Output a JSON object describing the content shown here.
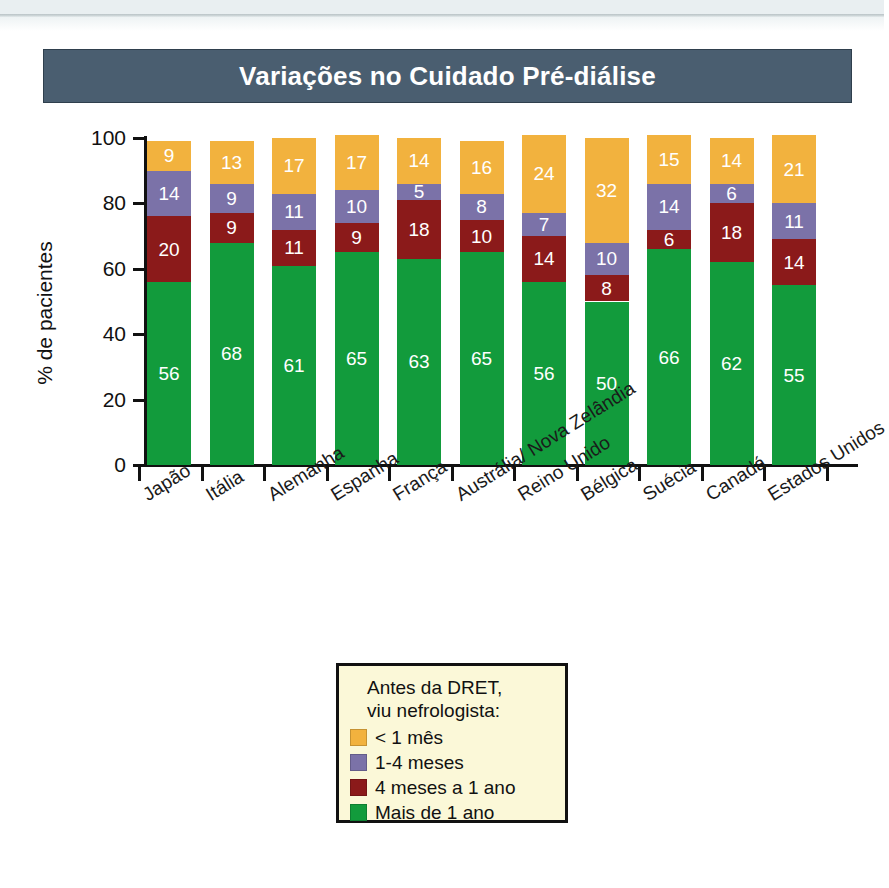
{
  "page": {
    "title_banner": "Variações no Cuidado Pré-diálise"
  },
  "chart_data": {
    "type": "bar",
    "stacked": true,
    "title": "Variações no Cuidado Pré-diálise",
    "xlabel": "",
    "ylabel": "% de pacientes",
    "ylim": [
      0,
      100
    ],
    "yticks": [
      0,
      20,
      40,
      60,
      80,
      100
    ],
    "ytick_labels": [
      "0",
      "20",
      "40",
      "60",
      "80",
      "100"
    ],
    "grid": false,
    "legend_position": "below-center",
    "legend_title": "Antes da DRET,\nviu nefrologista:",
    "categories": [
      "Japão",
      "Itália",
      "Alemanha",
      "Espanha",
      "França",
      "Austrália/ Nova Zelândia",
      "Reino Unido",
      "Bélgica",
      "Suécia",
      "Canadá",
      "Estados Unidos"
    ],
    "series": [
      {
        "name": "Mais de 1 ano",
        "color": "#129b3c",
        "values": [
          56,
          68,
          61,
          65,
          63,
          65,
          56,
          50,
          66,
          62,
          55
        ]
      },
      {
        "name": "4 meses a 1 ano",
        "color": "#8b1a1a",
        "values": [
          20,
          9,
          11,
          9,
          18,
          10,
          14,
          8,
          6,
          18,
          14
        ]
      },
      {
        "name": "1-4 meses",
        "color": "#7b72a8",
        "values": [
          14,
          9,
          11,
          10,
          5,
          8,
          7,
          10,
          14,
          6,
          11
        ]
      },
      {
        "name": "< 1 mês",
        "color": "#f2b23e",
        "values": [
          9,
          13,
          17,
          17,
          14,
          16,
          24,
          32,
          15,
          14,
          21
        ]
      }
    ]
  },
  "legend": {
    "title_line1": "Antes da DRET,",
    "title_line2": "viu nefrologista:",
    "items": [
      {
        "label": "< 1 mês",
        "color": "#f2b23e"
      },
      {
        "label": "1-4 meses",
        "color": "#7b72a8"
      },
      {
        "label": "4 meses a 1 ano",
        "color": "#8b1a1a"
      },
      {
        "label": "Mais de 1 ano",
        "color": "#129b3c"
      }
    ]
  },
  "colors": {
    "title_bar": "#4a5e70",
    "legend_background": "#fbf8d8",
    "axis": "#111111",
    "page_background": "#ffffff"
  }
}
